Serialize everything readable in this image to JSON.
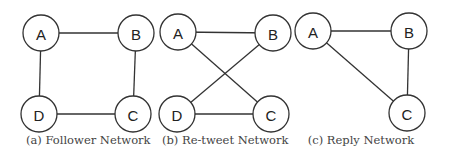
{
  "figure": {
    "stroke_color": "#333333",
    "node_radius": 18,
    "panels": [
      {
        "id": "a",
        "caption": "(a) Follower Network",
        "caption_left": 26,
        "caption_width": 122,
        "nodes": [
          {
            "label": "A",
            "x": 41,
            "y": 33
          },
          {
            "label": "B",
            "x": 136,
            "y": 33
          },
          {
            "label": "C",
            "x": 133,
            "y": 114
          },
          {
            "label": "D",
            "x": 39,
            "y": 114
          }
        ],
        "edges": [
          [
            "A",
            "B"
          ],
          [
            "B",
            "C"
          ],
          [
            "C",
            "D"
          ],
          [
            "D",
            "A"
          ]
        ]
      },
      {
        "id": "b",
        "caption": "(b) Re-tweet Network",
        "caption_left": 162,
        "caption_width": 126,
        "nodes": [
          {
            "label": "A",
            "x": 178,
            "y": 32
          },
          {
            "label": "B",
            "x": 273,
            "y": 33
          },
          {
            "label": "C",
            "x": 271,
            "y": 114
          },
          {
            "label": "D",
            "x": 177,
            "y": 114
          }
        ],
        "edges": [
          [
            "A",
            "B"
          ],
          [
            "A",
            "C"
          ],
          [
            "B",
            "D"
          ],
          [
            "D",
            "C"
          ]
        ]
      },
      {
        "id": "c",
        "caption": "(c) Reply Network",
        "caption_left": 306,
        "caption_width": 110,
        "nodes": [
          {
            "label": "A",
            "x": 313,
            "y": 31
          },
          {
            "label": "B",
            "x": 409,
            "y": 31
          },
          {
            "label": "C",
            "x": 407,
            "y": 113
          }
        ],
        "edges": [
          [
            "A",
            "B"
          ],
          [
            "B",
            "C"
          ],
          [
            "A",
            "C"
          ]
        ]
      }
    ]
  }
}
